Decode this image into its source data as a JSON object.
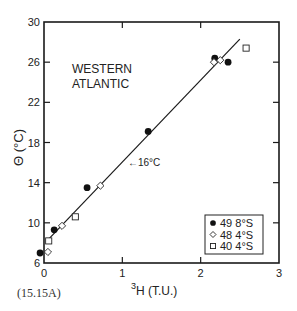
{
  "chart_data": {
    "type": "scatter",
    "title": "",
    "annotation_region": "WESTERN ATLANTIC",
    "region_line1": "WESTERN",
    "region_line2": "ATLANTIC",
    "line_annotation": "16°C",
    "xlabel": "³H (T.U.)",
    "xlabel_sup": "3",
    "xlabel_main": "H (T.U.)",
    "ylabel": "Θ (°C)",
    "xlim": [
      0,
      3
    ],
    "ylim": [
      6,
      30
    ],
    "x_ticks": [
      "0",
      "1",
      "2",
      "3"
    ],
    "y_ticks": [
      "6",
      "10",
      "14",
      "18",
      "22",
      "26",
      "30"
    ],
    "grid": false,
    "legend_position": "lower right",
    "series": [
      {
        "name": "49 8°S",
        "marker": "filled-circle",
        "points": [
          [
            -0.05,
            7.0
          ],
          [
            0.13,
            9.3
          ],
          [
            0.55,
            13.5
          ],
          [
            1.33,
            19.1
          ],
          [
            2.18,
            26.4
          ],
          [
            2.35,
            26.0
          ]
        ]
      },
      {
        "name": "48 4°S",
        "marker": "open-diamond",
        "points": [
          [
            0.05,
            7.1
          ],
          [
            0.23,
            9.7
          ],
          [
            0.72,
            13.7
          ],
          [
            2.17,
            26.0
          ],
          [
            2.25,
            26.2
          ]
        ]
      },
      {
        "name": "40 4°S",
        "marker": "open-square",
        "points": [
          [
            0.06,
            8.2
          ],
          [
            0.4,
            10.6
          ],
          [
            2.58,
            27.4
          ]
        ]
      }
    ],
    "fit_line": {
      "x": [
        0.05,
        2.5
      ],
      "y": [
        8.3,
        28.3
      ]
    },
    "legend": [
      {
        "symbol": "●",
        "station": "49",
        "lat": "8°S"
      },
      {
        "symbol": "◇",
        "station": "48",
        "lat": "4°S"
      },
      {
        "symbol": "□",
        "station": "40",
        "lat": "4°S"
      }
    ]
  },
  "figure_label": "(15.15A)"
}
